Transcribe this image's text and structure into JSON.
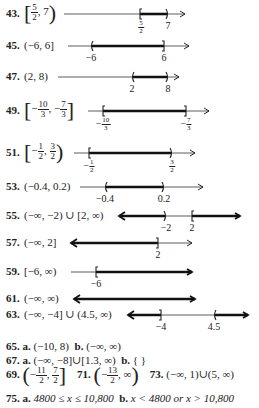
{
  "answers": [
    {
      "num": "43.",
      "interval": {
        "open": "[",
        "a_num": "5",
        "a_den": "2",
        "b": "7",
        "close": ")"
      },
      "line": {
        "x1": 64,
        "x2": 185,
        "y": 14,
        "seg": [
          140,
          168
        ],
        "left": "[",
        "right": ")",
        "arrowL": false,
        "arrowR": false
      },
      "labels": [
        {
          "x": 141,
          "num": "5",
          "den": "2"
        },
        {
          "x": 168,
          "text": "7"
        }
      ]
    },
    {
      "num": "45.",
      "interval_text": "(−6, 6]",
      "line": {
        "x1": 68,
        "x2": 189,
        "y": 46,
        "seg": [
          91,
          164
        ],
        "left": "(",
        "right": "]"
      },
      "labels": [
        {
          "x": 91,
          "text": "−6"
        },
        {
          "x": 164,
          "text": "6"
        }
      ]
    },
    {
      "num": "47.",
      "interval_text": "(2, 8)",
      "line": {
        "x1": 58,
        "x2": 179,
        "y": 77,
        "seg": [
          132,
          168
        ],
        "left": "(",
        "right": ")"
      },
      "labels": [
        {
          "x": 132,
          "text": "2"
        },
        {
          "x": 168,
          "text": "8"
        }
      ]
    },
    {
      "num": "49.",
      "interval": {
        "open": "[",
        "a_num": "10",
        "a_den": "3",
        "b_num": "7",
        "b_den": "3",
        "close": "]",
        "neg": true
      },
      "line": {
        "x1": 88,
        "x2": 209,
        "y": 111,
        "seg": [
          103,
          186
        ],
        "left": "[",
        "right": "]"
      },
      "labels": [
        {
          "x": 103,
          "num": "10",
          "den": "3",
          "neg": true
        },
        {
          "x": 186,
          "num": "7",
          "den": "3",
          "neg": true
        }
      ]
    },
    {
      "num": "51.",
      "interval": {
        "open": "[",
        "a_num": "1",
        "a_den": "2",
        "b_num": "3",
        "b_den": "2",
        "close": ")",
        "neg_a": true
      },
      "line": {
        "x1": 74,
        "x2": 195,
        "y": 153,
        "seg": [
          89,
          172
        ],
        "left": "[",
        "right": ")"
      },
      "labels": [
        {
          "x": 89,
          "num": "1",
          "den": "2",
          "neg": true
        },
        {
          "x": 172,
          "num": "3",
          "den": "2"
        }
      ]
    },
    {
      "num": "53.",
      "interval_text": "(−0.4, 0.2)",
      "line": {
        "x1": 80,
        "x2": 203,
        "y": 187,
        "seg": [
          105,
          164
        ],
        "left": "(",
        "right": ")"
      },
      "labels": [
        {
          "x": 105,
          "text": "−0.4"
        },
        {
          "x": 164,
          "text": "0.2"
        }
      ]
    },
    {
      "num": "55.",
      "interval_text": "(−∞, −2) ∪ [2, ∞)",
      "line": {
        "x1": 119,
        "x2": 240,
        "y": 216,
        "segs": [
          [
            119,
            166
          ],
          [
            192,
            240
          ]
        ],
        "marks": [
          {
            "x": 166,
            "t": ")"
          },
          {
            "x": 192,
            "t": "["
          }
        ],
        "arrowL": true,
        "arrowR": true
      },
      "labels": [
        {
          "x": 166,
          "text": "−2"
        },
        {
          "x": 192,
          "text": "2"
        }
      ]
    },
    {
      "num": "57.",
      "interval_text": "(−∞, 2]",
      "line": {
        "x1": 71,
        "x2": 192,
        "y": 243,
        "seg": [
          71,
          158
        ],
        "right": "]",
        "arrowL": true
      },
      "labels": [
        {
          "x": 158,
          "text": "2"
        }
      ]
    },
    {
      "num": "59.",
      "interval_text": "[−6, ∞)",
      "line": {
        "x1": 71,
        "x2": 192,
        "y": 272,
        "seg": [
          96,
          192
        ],
        "left": "[",
        "arrowR": true
      },
      "labels": [
        {
          "x": 96,
          "text": "−6"
        }
      ]
    },
    {
      "num": "61.",
      "interval_text": "(−∞, ∞)",
      "line": {
        "x1": 74,
        "x2": 195,
        "y": 299,
        "seg": [
          74,
          195
        ],
        "arrowL": true,
        "arrowR": true
      },
      "labels": []
    },
    {
      "num": "63.",
      "interval_text": "(−∞, −4] ∪ (4.5, ∞)",
      "line": {
        "x1": 128,
        "x2": 248,
        "y": 315,
        "segs": [
          [
            128,
            161
          ],
          [
            214,
            248
          ]
        ],
        "marks": [
          {
            "x": 161,
            "t": "]"
          },
          {
            "x": 214,
            "t": "("
          }
        ],
        "arrowL": true,
        "arrowR": true
      },
      "labels": [
        {
          "x": 161,
          "text": "−4"
        },
        {
          "x": 214,
          "text": "4.5"
        }
      ]
    }
  ],
  "text_answers": {
    "a65": {
      "num": "65.",
      "a": "a.",
      "a_val": "(−10, 8)",
      "b": "b.",
      "b_val": "(−∞, ∞)"
    },
    "a67": {
      "num": "67.",
      "a": "a.",
      "a_val": "(−∞, −8]∪[1.3, ∞)",
      "b": "b.",
      "b_val": "{ }"
    },
    "a69": {
      "num": "69.",
      "a_num": "11",
      "a_den": "2",
      "b_num": "7",
      "b_den": "2"
    },
    "a71": {
      "num": "71.",
      "a_num": "13",
      "a_den": "2",
      "b": "∞"
    },
    "a73": {
      "num": "73.",
      "val": "(−∞, 1)∪(5, ∞)"
    },
    "a75": {
      "num": "75.",
      "a": "a.",
      "a_val": "4800 ≤ x ≤ 10,800",
      "b": "b.",
      "b_val": "x < 4800  or  x > 10,800"
    }
  }
}
